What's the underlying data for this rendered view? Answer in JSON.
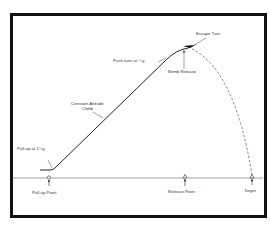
{
  "diagram": {
    "labels": {
      "escape_turn": "Escape Turn",
      "push_over": "Push over at ½g",
      "bomb_release": "Bomb Release",
      "climb_line1": "Constant Attitude",
      "climb_line2": "Climb",
      "pull_up": "Pull-up at 1½g",
      "pull_up_point": "Pull-up Point",
      "release_point": "Release Point",
      "target": "Target"
    },
    "colors": {
      "line": "#222222",
      "dashed": "#666666",
      "ground": "#888888",
      "frame": "#111111"
    },
    "markers": [
      {
        "name": "pull-up-point",
        "x": 49
      },
      {
        "name": "release-point",
        "x": 185
      },
      {
        "name": "target",
        "x": 252
      }
    ]
  }
}
